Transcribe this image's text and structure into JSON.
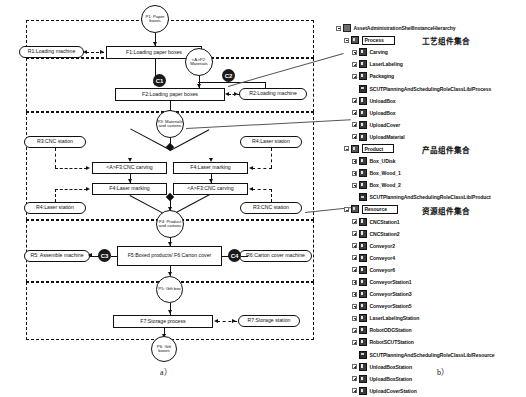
{
  "figure": {
    "label_a": "a）",
    "label_b": "b）"
  },
  "diagram": {
    "zones": [
      {
        "name": "zone-loading"
      },
      {
        "name": "zone-machining"
      },
      {
        "name": "zone-assembly"
      },
      {
        "name": "zone-storage"
      }
    ],
    "products": [
      {
        "id": "p1",
        "text": "P1: Paper boxes"
      },
      {
        "id": "p2",
        "text": "<A>P2: Materials"
      },
      {
        "id": "p3",
        "text": "P3: Materials and cartons"
      },
      {
        "id": "p4",
        "text": "P4: Product and cartons"
      },
      {
        "id": "p5",
        "text": "P5: Gift box"
      },
      {
        "id": "p6",
        "text": "P6: Gift boxes"
      }
    ],
    "functions": [
      {
        "id": "f1",
        "text": "F1:Loading paper boxes"
      },
      {
        "id": "f2",
        "text": "F2:Loading paper boxes"
      },
      {
        "id": "f3a",
        "text": "<A>F3:CNC carving"
      },
      {
        "id": "f4a",
        "text": "F4:Laser marking"
      },
      {
        "id": "f4b",
        "text": "F4:Laser marking"
      },
      {
        "id": "f3b",
        "text": "<A>F3:CNC carving"
      },
      {
        "id": "f5f6",
        "text": "F5:Boxed products/ F6:Carton cover"
      },
      {
        "id": "f7",
        "text": "F7:Storage process"
      }
    ],
    "resources": [
      {
        "id": "r1",
        "text": "R1:Loading machine"
      },
      {
        "id": "r2",
        "text": "R2:Loading machine"
      },
      {
        "id": "r3a",
        "text": "R3:CNC station"
      },
      {
        "id": "r4a",
        "text": "R4:Laser station"
      },
      {
        "id": "r4b",
        "text": "R4:Laser station"
      },
      {
        "id": "r3b",
        "text": "R3:CNC station"
      },
      {
        "id": "r5",
        "text": "R5: Assemble machine"
      },
      {
        "id": "r6",
        "text": "R6:Carton cover machine"
      },
      {
        "id": "r7",
        "text": "R7:Storage station"
      }
    ],
    "constraints": [
      {
        "id": "c1",
        "text": "C1"
      },
      {
        "id": "c2",
        "text": "C2"
      },
      {
        "id": "c3",
        "text": "C3"
      },
      {
        "id": "c4",
        "text": "C4"
      }
    ]
  },
  "tree": {
    "root": "AssetAdministrationShellInstanceHierarchy",
    "annotations": {
      "process": "工艺组件集合",
      "product": "产品组件集合",
      "resource": "资源组件集合"
    },
    "nodes": [
      {
        "label": "AssetAdministrationShellInstanceHierarchy",
        "depth": 0,
        "icon": "root-icon",
        "expander": "minus",
        "boxed": false
      },
      {
        "label": "Process",
        "depth": 1,
        "icon": "group-icon",
        "expander": "minus",
        "boxed": true
      },
      {
        "label": "Carving",
        "depth": 2,
        "icon": "leaf-icon",
        "expander": "plus",
        "boxed": false
      },
      {
        "label": "LaserLabeling",
        "depth": 2,
        "icon": "leaf-icon",
        "expander": "plus",
        "boxed": false
      },
      {
        "label": "Packaging",
        "depth": 2,
        "icon": "leaf-icon",
        "expander": "plus",
        "boxed": false
      },
      {
        "label": "SCUTPlanningAndSchedulingRoleClassLib/Process",
        "depth": 2,
        "icon": "role-icon",
        "expander": "none",
        "boxed": false
      },
      {
        "label": "UnloadBox",
        "depth": 2,
        "icon": "leaf-icon",
        "expander": "plus",
        "boxed": false
      },
      {
        "label": "UploadBox",
        "depth": 2,
        "icon": "leaf-icon",
        "expander": "plus",
        "boxed": false
      },
      {
        "label": "UploadCover",
        "depth": 2,
        "icon": "leaf-icon",
        "expander": "plus",
        "boxed": false
      },
      {
        "label": "UploadMaterial",
        "depth": 2,
        "icon": "leaf-icon",
        "expander": "plus",
        "boxed": false
      },
      {
        "label": "Product",
        "depth": 1,
        "icon": "group-icon",
        "expander": "minus",
        "boxed": true
      },
      {
        "label": "Box_UDisk",
        "depth": 2,
        "icon": "leaf-icon",
        "expander": "plus",
        "boxed": false
      },
      {
        "label": "Box_Wood_1",
        "depth": 2,
        "icon": "leaf-icon",
        "expander": "plus",
        "boxed": false
      },
      {
        "label": "Box_Wood_2",
        "depth": 2,
        "icon": "leaf-icon",
        "expander": "plus",
        "boxed": false
      },
      {
        "label": "SCUTPlanningAndSchedulingRoleClassLib/Product",
        "depth": 2,
        "icon": "role-icon",
        "expander": "none",
        "boxed": false
      },
      {
        "label": "Resource",
        "depth": 1,
        "icon": "group-icon",
        "expander": "minus",
        "boxed": true
      },
      {
        "label": "CNCStation1",
        "depth": 2,
        "icon": "leaf-icon",
        "expander": "plus",
        "boxed": false
      },
      {
        "label": "CNCStation2",
        "depth": 2,
        "icon": "leaf-icon",
        "expander": "plus",
        "boxed": false
      },
      {
        "label": "Conveyor2",
        "depth": 2,
        "icon": "leaf-icon",
        "expander": "plus",
        "boxed": false
      },
      {
        "label": "Conveyor4",
        "depth": 2,
        "icon": "leaf-icon",
        "expander": "plus",
        "boxed": false
      },
      {
        "label": "Conveyor6",
        "depth": 2,
        "icon": "leaf-icon",
        "expander": "plus",
        "boxed": false
      },
      {
        "label": "ConveyorStation1",
        "depth": 2,
        "icon": "leaf-icon",
        "expander": "plus",
        "boxed": false
      },
      {
        "label": "ConveyorStation3",
        "depth": 2,
        "icon": "leaf-icon",
        "expander": "plus",
        "boxed": false
      },
      {
        "label": "ConveyorStation5",
        "depth": 2,
        "icon": "leaf-icon",
        "expander": "plus",
        "boxed": false
      },
      {
        "label": "LaserLabelingStation",
        "depth": 2,
        "icon": "leaf-icon",
        "expander": "plus",
        "boxed": false
      },
      {
        "label": "RobotODGStation",
        "depth": 2,
        "icon": "leaf-icon",
        "expander": "plus",
        "boxed": false
      },
      {
        "label": "RobotSCUTStation",
        "depth": 2,
        "icon": "leaf-icon",
        "expander": "plus",
        "boxed": false
      },
      {
        "label": "SCUTPlanningAndSchedulingRoleClassLib/Resource",
        "depth": 2,
        "icon": "role-icon",
        "expander": "none",
        "boxed": false
      },
      {
        "label": "UnloadBoxStation",
        "depth": 2,
        "icon": "leaf-icon",
        "expander": "plus",
        "boxed": false
      },
      {
        "label": "UploadBoxStation",
        "depth": 2,
        "icon": "leaf-icon",
        "expander": "plus",
        "boxed": false
      },
      {
        "label": "UploadCoverStation",
        "depth": 2,
        "icon": "leaf-icon",
        "expander": "plus",
        "boxed": false
      }
    ]
  }
}
